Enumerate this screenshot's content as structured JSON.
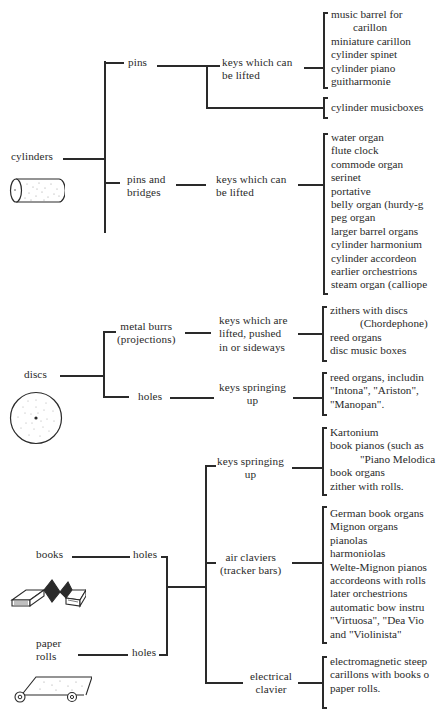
{
  "diagram": {
    "sources": [
      {
        "label": "cylinders",
        "icon": "cylinder-icon"
      },
      {
        "label": "discs",
        "icon": "disc-icon"
      },
      {
        "label": "books",
        "icon": "folded-book-icon"
      },
      {
        "label": "paper rolls",
        "icon": "paper-roll-icon"
      }
    ],
    "cylinders": {
      "label": "cylinders",
      "branch1": {
        "label": "pins",
        "mechanism": "keys which can be lifted",
        "mechanism_lines": [
          "keys which can",
          "be lifted"
        ],
        "instruments": [
          "music barrel for",
          "carillon",
          "miniature carillon",
          "cylinder spinet",
          "cylinder piano",
          "guitharmonie"
        ],
        "direct_instruments": [
          "cylinder musicboxes"
        ]
      },
      "branch2": {
        "label_lines": [
          "pins and",
          "bridges"
        ],
        "mechanism_lines": [
          "keys which can",
          "be lifted"
        ],
        "instruments": [
          "water organ",
          "flute clock",
          "commode organ",
          "serinet",
          "portative",
          "belly organ  (hurdy-g",
          "peg organ",
          "larger barrel organs",
          "cylinder harmonium",
          "cylinder accordeon",
          "earlier orchestrions",
          "steam organ  (calliope"
        ]
      }
    },
    "discs": {
      "label": "discs",
      "branch1": {
        "label_lines": [
          "metal burrs",
          "(projections)"
        ],
        "mechanism_lines": [
          "keys which are",
          "lifted, pushed",
          "in or sideways"
        ],
        "instruments": [
          "zithers with discs",
          "(Chordephone)",
          "reed organs",
          "disc music boxes"
        ]
      },
      "branch2": {
        "label": "holes",
        "mechanism_lines": [
          "keys springing",
          "up"
        ],
        "instruments": [
          "reed organs, includin",
          "\"Intona\", \"Ariston\",",
          "\"Manopan\"."
        ]
      }
    },
    "books_rolls": {
      "books_label": "books",
      "books_holes": "holes",
      "rolls_label_lines": [
        "paper",
        "rolls"
      ],
      "rolls_holes": "holes",
      "branch1": {
        "mechanism_lines": [
          "keys springing",
          "up"
        ],
        "instruments": [
          "Kartonium",
          "book pianos (such as",
          "\"Piano Melodica",
          "book organs",
          "zither with rolls."
        ]
      },
      "branch2": {
        "mechanism_lines": [
          "air claviers",
          "(tracker bars)"
        ],
        "instruments": [
          "German book organs",
          "Mignon organs",
          "pianolas",
          "harmoniolas",
          "Welte-Mignon pianos",
          "accordeons with rolls",
          "later orchestrions",
          "automatic bow instru",
          "\"Virtuosa\", \"Dea Vio",
          "and \"Violinista\""
        ]
      },
      "branch3": {
        "mechanism_lines": [
          "electrical",
          "clavier"
        ],
        "instruments": [
          "electromagnetic steep",
          "carillons with books o",
          "paper rolls."
        ]
      }
    },
    "colors": {
      "ink": "#2a2a2a",
      "paper": "#ffffff"
    }
  }
}
